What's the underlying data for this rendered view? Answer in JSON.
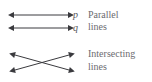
{
  "figure": {
    "background_color": "#ffffff",
    "stroke_color": "#3a3a3e",
    "text_color": "#6b6b6f",
    "label_color": "#58585c"
  },
  "parallel_group": {
    "caption_line1": "Parallel",
    "caption_line2": "lines",
    "lines": [
      {
        "name": "line-p",
        "label": "p",
        "x1": 12,
        "y1": 15,
        "x2": 70,
        "y2": 15,
        "arrowheads": "both"
      },
      {
        "name": "line-q",
        "label": "q",
        "x1": 12,
        "y1": 28,
        "x2": 70,
        "y2": 28,
        "arrowheads": "both"
      }
    ]
  },
  "intersecting_group": {
    "caption_line1": "Intersecting",
    "caption_line2": "lines",
    "lines": [
      {
        "name": "line-down",
        "label": "",
        "x1": 13,
        "y1": 54,
        "x2": 71,
        "y2": 71,
        "arrowheads": "both"
      },
      {
        "name": "line-up",
        "label": "",
        "x1": 13,
        "y1": 71,
        "x2": 71,
        "y2": 54,
        "arrowheads": "both"
      }
    ]
  },
  "icons": {
    "arrowhead": "arrow-head-icon"
  }
}
